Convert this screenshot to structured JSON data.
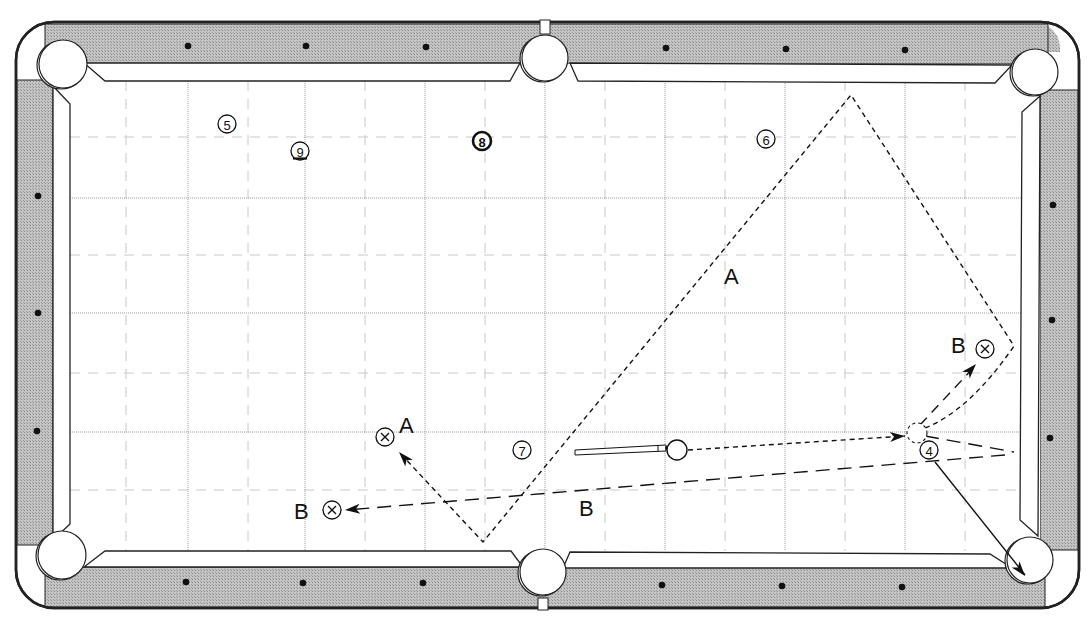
{
  "diagram": {
    "colors": {
      "rail": "#bdbdbd",
      "rail_stroke": "#222222",
      "cloth": "#ffffff",
      "cushion": "#ffffff",
      "grid_major": "#9a9a9a",
      "grid_minor": "#c8c8c8",
      "ink": "#111111",
      "diamond": "#111111"
    },
    "table": {
      "outer": {
        "x": 16,
        "y": 22,
        "w": 1063,
        "h": 586,
        "r": 38
      },
      "playfield": {
        "x1": 70,
        "y1": 81,
        "x2": 1021,
        "y2": 551
      }
    },
    "pockets": [
      {
        "name": "top-left",
        "cx": 63,
        "cy": 64,
        "r": 24
      },
      {
        "name": "top-middle",
        "cx": 545,
        "cy": 58,
        "r": 23
      },
      {
        "name": "top-right",
        "cx": 1035,
        "cy": 72,
        "r": 23
      },
      {
        "name": "bottom-left",
        "cx": 62,
        "cy": 555,
        "r": 24
      },
      {
        "name": "bottom-middle",
        "cx": 543,
        "cy": 572,
        "r": 23
      },
      {
        "name": "bottom-right",
        "cx": 1030,
        "cy": 560,
        "r": 23
      }
    ],
    "diamonds": [
      {
        "x": 188,
        "y": 46
      },
      {
        "x": 306,
        "y": 46
      },
      {
        "x": 426,
        "y": 47
      },
      {
        "x": 666,
        "y": 48
      },
      {
        "x": 786,
        "y": 49
      },
      {
        "x": 905,
        "y": 50
      },
      {
        "x": 186,
        "y": 582
      },
      {
        "x": 303,
        "y": 583
      },
      {
        "x": 423,
        "y": 583
      },
      {
        "x": 662,
        "y": 585
      },
      {
        "x": 782,
        "y": 586
      },
      {
        "x": 902,
        "y": 587
      },
      {
        "x": 38,
        "y": 196
      },
      {
        "x": 38,
        "y": 313
      },
      {
        "x": 37,
        "y": 431
      },
      {
        "x": 1053,
        "y": 205
      },
      {
        "x": 1052,
        "y": 320
      },
      {
        "x": 1050,
        "y": 438
      }
    ],
    "grid": {
      "major_x": [
        188,
        305,
        425,
        545,
        665,
        785,
        905
      ],
      "minor_x": [
        126,
        248,
        365,
        485,
        605,
        725,
        845,
        965
      ],
      "major_y": [
        198,
        313,
        432
      ],
      "minor_y": [
        137,
        255,
        373,
        490
      ]
    },
    "balls": [
      {
        "number": "5",
        "x": 227,
        "y": 124,
        "style": "plain"
      },
      {
        "number": "9",
        "x": 300,
        "y": 151,
        "style": "stripe"
      },
      {
        "number": "8",
        "x": 482,
        "y": 141,
        "style": "bold"
      },
      {
        "number": "6",
        "x": 766,
        "y": 139,
        "style": "plain"
      },
      {
        "number": "7",
        "x": 522,
        "y": 450,
        "style": "plain"
      },
      {
        "number": "4",
        "x": 929,
        "y": 450,
        "style": "plain"
      }
    ],
    "cue_ball": {
      "x": 677,
      "y": 450,
      "r": 10
    },
    "ghost_ball": {
      "x": 917,
      "y": 433,
      "r": 10
    },
    "cue_stick": {
      "x1": 575,
      "y1": 452,
      "x2": 666,
      "y2": 448
    },
    "target_markers": [
      {
        "label": "A",
        "x": 385,
        "y": 437,
        "label_x": 399,
        "label_y": 433
      },
      {
        "label": "B",
        "x": 332,
        "y": 510,
        "label_x": 294,
        "label_y": 519
      },
      {
        "label": "B",
        "x": 985,
        "y": 349,
        "label_x": 951,
        "label_y": 353
      }
    ],
    "path_labels": [
      {
        "text": "A",
        "x": 724,
        "y": 284
      },
      {
        "text": "B",
        "x": 579,
        "y": 516
      }
    ],
    "paths": {
      "cue_to_ghost": "M 688 450 L 905 436",
      "path_A": "M 925 428 Q 970 410 1014 346 L 851 95 L 483 542 L 399 452",
      "path_B_out": "M 925 436 L 1014 452",
      "path_B_return": "M 1005 455 L 347 510",
      "b_deflect": "M 920 425 L 975 366",
      "object_ball_4": "M 935 462 L 1025 575"
    },
    "arrowheads": [
      {
        "x": 905,
        "y": 436,
        "angle": -3.5
      },
      {
        "x": 399,
        "y": 452,
        "angle": -132
      },
      {
        "x": 345,
        "y": 510,
        "angle": 175
      },
      {
        "x": 976,
        "y": 364,
        "angle": -48
      },
      {
        "x": 1025,
        "y": 576,
        "angle": 51
      }
    ]
  }
}
